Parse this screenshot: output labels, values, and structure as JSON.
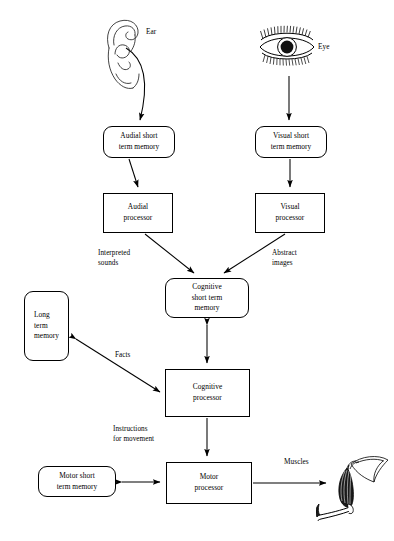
{
  "diagram": {
    "background_color": "#ffffff",
    "stroke_color": "#000000",
    "nodes": [
      {
        "id": "audial_stm",
        "label_lines": [
          "Audial short",
          "term memory"
        ],
        "shape": "rounded-rect",
        "x": 103,
        "y": 126,
        "w": 72,
        "h": 32
      },
      {
        "id": "visual_stm",
        "label_lines": [
          "Visual short",
          "term memory"
        ],
        "shape": "rounded-rect",
        "x": 255,
        "y": 126,
        "w": 72,
        "h": 32
      },
      {
        "id": "audial_proc",
        "label_lines": [
          "Audial",
          "processor"
        ],
        "shape": "rect",
        "x": 103,
        "y": 193,
        "w": 70,
        "h": 40
      },
      {
        "id": "visual_proc",
        "label_lines": [
          "Visual",
          "processor"
        ],
        "shape": "rect",
        "x": 255,
        "y": 193,
        "w": 70,
        "h": 40
      },
      {
        "id": "cognitive_stm",
        "label_lines": [
          "Cognitive",
          "short term",
          "memory"
        ],
        "shape": "rounded-rect",
        "x": 165,
        "y": 278,
        "w": 84,
        "h": 40
      },
      {
        "id": "long_term",
        "label_lines": [
          "Long",
          "term",
          "memory"
        ],
        "shape": "rounded-rect",
        "x": 24,
        "y": 291,
        "w": 45,
        "h": 70,
        "align": "left"
      },
      {
        "id": "cognitive_proc",
        "label_lines": [
          "Cognitive",
          "processor"
        ],
        "shape": "rect",
        "x": 165,
        "y": 369,
        "w": 85,
        "h": 48
      },
      {
        "id": "motor_stm",
        "label_lines": [
          "Motor short",
          "term memory"
        ],
        "shape": "rounded-rect",
        "x": 38,
        "y": 466,
        "w": 78,
        "h": 31
      },
      {
        "id": "motor_proc",
        "label_lines": [
          "Motor",
          "processor"
        ],
        "shape": "rect",
        "x": 166,
        "y": 462,
        "w": 86,
        "h": 42
      }
    ],
    "edge_labels": [
      {
        "id": "interpreted_sounds",
        "lines": [
          "Interpreted",
          "sounds"
        ],
        "x": 98,
        "y": 248
      },
      {
        "id": "abstract_images",
        "lines": [
          "Abstract",
          "images"
        ],
        "x": 272,
        "y": 248
      },
      {
        "id": "facts",
        "lines": [
          "Facts"
        ],
        "x": 115,
        "y": 350
      },
      {
        "id": "instructions_movement",
        "lines": [
          "Instructions",
          "for movement"
        ],
        "x": 113,
        "y": 424
      }
    ],
    "organ_labels": [
      {
        "id": "ear_label",
        "text": "Ear",
        "x": 146,
        "y": 27
      },
      {
        "id": "eye_label",
        "text": "Eye",
        "x": 318,
        "y": 42
      },
      {
        "id": "muscles_label",
        "text": "Muscles",
        "x": 284,
        "y": 457
      }
    ],
    "illustrations": [
      {
        "id": "ear-illustration",
        "name": "ear",
        "x": 95,
        "y": 14,
        "w": 62,
        "h": 84
      },
      {
        "id": "eye-illustration",
        "name": "eye",
        "x": 252,
        "y": 22,
        "w": 70,
        "h": 52
      },
      {
        "id": "muscles-illustration",
        "name": "muscles",
        "x": 316,
        "y": 452,
        "w": 78,
        "h": 76
      }
    ],
    "connections": [
      {
        "from": "ear",
        "to": "audial_stm",
        "type": "arrow"
      },
      {
        "from": "eye",
        "to": "visual_stm",
        "type": "arrow"
      },
      {
        "from": "audial_stm",
        "to": "audial_proc",
        "type": "arrow"
      },
      {
        "from": "visual_stm",
        "to": "visual_proc",
        "type": "arrow"
      },
      {
        "from": "audial_proc",
        "to": "cognitive_stm",
        "type": "arrow",
        "label": "Interpreted sounds"
      },
      {
        "from": "visual_proc",
        "to": "cognitive_stm",
        "type": "arrow",
        "label": "Abstract images"
      },
      {
        "from": "cognitive_stm",
        "to": "cognitive_proc",
        "type": "double-arrow"
      },
      {
        "from": "long_term",
        "to": "cognitive_proc",
        "type": "double-arrow",
        "label": "Facts"
      },
      {
        "from": "cognitive_proc",
        "to": "motor_proc",
        "type": "arrow",
        "label": "Instructions for movement"
      },
      {
        "from": "motor_stm",
        "to": "motor_proc",
        "type": "double-arrow"
      },
      {
        "from": "motor_proc",
        "to": "muscles",
        "type": "arrow"
      }
    ]
  }
}
